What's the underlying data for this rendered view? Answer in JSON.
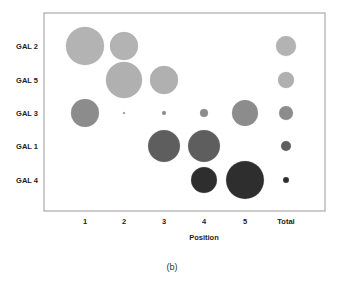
{
  "caption": "(b)",
  "chart_data": {
    "type": "bubble",
    "title": "",
    "xlabel": "Position",
    "ylabel": "",
    "categories": [
      "1",
      "2",
      "3",
      "4",
      "5",
      "Total"
    ],
    "rows": [
      "GAL 2",
      "GAL 5",
      "GAL 3",
      "GAL 1",
      "GAL 4"
    ],
    "grid": false,
    "legend": null,
    "series": [
      {
        "name": "GAL 2",
        "color": "#b3b3b3",
        "radii": [
          19,
          14,
          0,
          0,
          0,
          10
        ]
      },
      {
        "name": "GAL 5",
        "color": "#b0b0b0",
        "radii": [
          0,
          18,
          14,
          0,
          0,
          8
        ]
      },
      {
        "name": "GAL 3",
        "color": "#8c8c8c",
        "radii": [
          14,
          1,
          2,
          4,
          13,
          7
        ]
      },
      {
        "name": "GAL 1",
        "color": "#5e5e5e",
        "radii": [
          0,
          0,
          16,
          16,
          0,
          5
        ]
      },
      {
        "name": "GAL 4",
        "color": "#2e2e2e",
        "radii": [
          0,
          0,
          0,
          13,
          19,
          3
        ]
      }
    ],
    "note": "Values are approximate bubble radii in px (relative sizes); empty cells have no bubble."
  },
  "layout": {
    "frame": {
      "left": 44,
      "top": 13,
      "right": 325,
      "bottom": 211
    },
    "col_x": [
      85,
      124,
      164,
      204,
      245,
      286
    ],
    "row_y": [
      46,
      80,
      113,
      146,
      180
    ],
    "row_label_x": 38,
    "col_label_y": 224,
    "xlabel_pos": [
      204,
      240
    ],
    "caption_pos": [
      172,
      270
    ],
    "frame_color": "#aaaaaa"
  }
}
